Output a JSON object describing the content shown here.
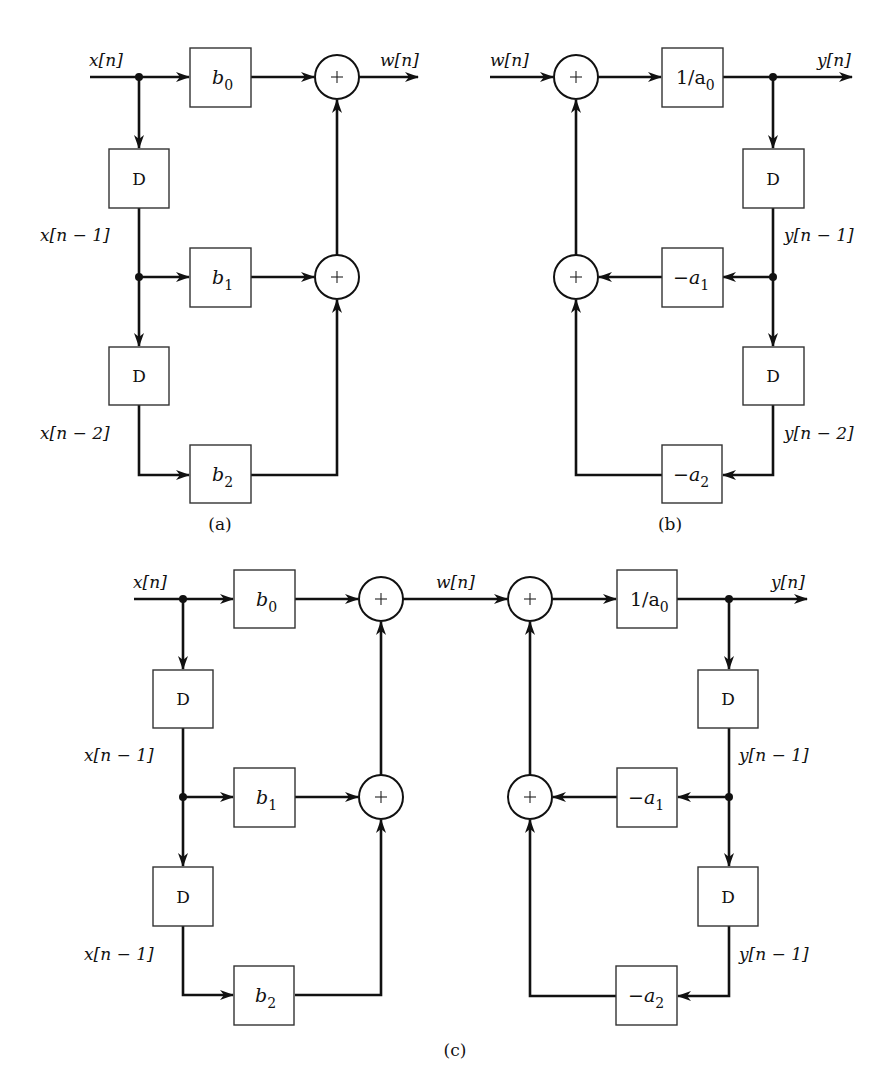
{
  "figure": {
    "panels": [
      {
        "id": "a",
        "caption": "(a)",
        "title": "Nonrecursive (FIR) section",
        "signals": {
          "input": "x[n]",
          "output": "w[n]",
          "delay1": "x[n − 1]",
          "delay2": "x[n − 2]"
        },
        "blocks": {
          "coef0": {
            "base": "b",
            "sub": "0"
          },
          "coef1": {
            "base": "b",
            "sub": "1"
          },
          "coef2": {
            "base": "b",
            "sub": "2"
          },
          "delay": "D"
        },
        "adder_symbol": "+"
      },
      {
        "id": "b",
        "caption": "(b)",
        "title": "Recursive (IIR) section",
        "signals": {
          "input": "w[n]",
          "output": "y[n]",
          "delay1": "y[n − 1]",
          "delay2": "y[n − 2]"
        },
        "blocks": {
          "gain": {
            "base": "1/a",
            "sub": "0"
          },
          "coef1": {
            "base": "−a",
            "sub": "1"
          },
          "coef2": {
            "base": "−a",
            "sub": "2"
          },
          "delay": "D"
        },
        "adder_symbol": "+"
      },
      {
        "id": "c",
        "caption": "(c)",
        "title": "Cascade of (a) and (b)",
        "signals": {
          "input": "x[n]",
          "intermediate": "w[n]",
          "output": "y[n]",
          "x_delay1": "x[n − 1]",
          "x_delay2": "x[n − 1]",
          "y_delay1": "y[n − 1]",
          "y_delay2": "y[n − 1]"
        },
        "blocks": {
          "b0": {
            "base": "b",
            "sub": "0"
          },
          "b1": {
            "base": "b",
            "sub": "1"
          },
          "b2": {
            "base": "b",
            "sub": "2"
          },
          "gain": {
            "base": "1/a",
            "sub": "0"
          },
          "a1": {
            "base": "−a",
            "sub": "1"
          },
          "a2": {
            "base": "−a",
            "sub": "2"
          },
          "delay": "D"
        },
        "adder_symbol": "+"
      }
    ]
  }
}
